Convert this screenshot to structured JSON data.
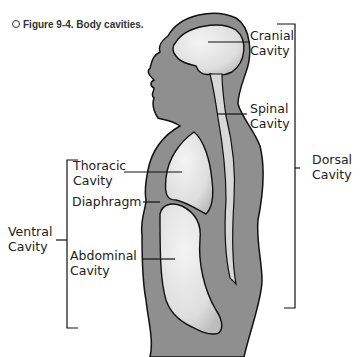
{
  "caption": {
    "marker": "○",
    "text": "Figure 9-4. Body cavities."
  },
  "labels": {
    "cranial": [
      "Cranial",
      "Cavity"
    ],
    "spinal": [
      "Spinal",
      "Cavity"
    ],
    "dorsal": [
      "Dorsal",
      "Cavity"
    ],
    "thoracic": [
      "Thoracic",
      "Cavity"
    ],
    "diaphragm": "Diaphragm",
    "ventral": [
      "Ventral",
      "Cavity"
    ],
    "abdominal": [
      "Abdominal",
      "Cavity"
    ]
  },
  "colors": {
    "body_fill": "#8f8f8f",
    "cavity_fill": "#e6e6e6",
    "outline": "#111111",
    "text": "#222222"
  }
}
